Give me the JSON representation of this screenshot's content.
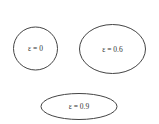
{
  "diagram": {
    "ellipses": [
      {
        "label": "ε = 0",
        "eccentricity": "0",
        "shape": "circle"
      },
      {
        "label": "ε = 0.6",
        "eccentricity": "0.6",
        "shape": "ellipse"
      },
      {
        "label": "ε = 0.9",
        "eccentricity": "0.9",
        "shape": "ellipse"
      }
    ]
  }
}
